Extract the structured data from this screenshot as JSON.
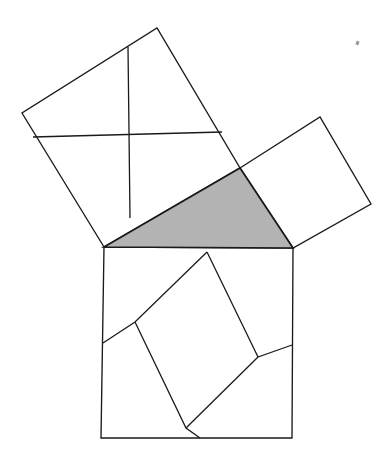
{
  "figure": {
    "background_color": "#ffffff",
    "line_color": "#1a1a1a",
    "shaded_fill_color": "#b3b3b3",
    "unshaded_fill_color": "#ffffff",
    "canvas": {
      "width": 391,
      "height": 468
    }
  },
  "shapes": {
    "triangle": {
      "name": "right-triangle",
      "fill": "#b3b3b3",
      "filled": true,
      "vertices": [
        [
          104,
          247
        ],
        [
          240,
          168
        ],
        [
          293,
          248
        ]
      ],
      "vertex_labels": [
        "left-vertex",
        "apex-vertex",
        "right-vertex"
      ]
    },
    "square_hypotenuse": {
      "name": "square-on-hypotenuse",
      "fill": "#ffffff",
      "filled": false,
      "position": "bottom",
      "vertices": [
        [
          104,
          247
        ],
        [
          293,
          248
        ],
        [
          292,
          438
        ],
        [
          101,
          438
        ]
      ]
    },
    "square_long_leg": {
      "name": "square-on-long-leg",
      "fill": "#ffffff",
      "filled": false,
      "position": "upper-left",
      "vertices": [
        [
          104,
          247
        ],
        [
          22,
          113
        ],
        [
          157,
          28
        ],
        [
          240,
          168
        ]
      ]
    },
    "square_short_leg": {
      "name": "square-on-short-leg",
      "fill": "#ffffff",
      "filled": false,
      "position": "upper-right",
      "vertices": [
        [
          240,
          168
        ],
        [
          320,
          117
        ],
        [
          371,
          204
        ],
        [
          293,
          248
        ]
      ]
    }
  },
  "dissection_lines": {
    "hypotenuse_square_cuts": [
      {
        "name": "cut-top-to-upper-left",
        "points": [
          [
            207,
            252
          ],
          [
            135,
            322
          ],
          [
            103,
            343
          ]
        ]
      },
      {
        "name": "cut-top-to-lower-right",
        "points": [
          [
            207,
            252
          ],
          [
            258,
            357
          ],
          [
            292,
            345
          ]
        ]
      },
      {
        "name": "cut-upper-left-to-bottom",
        "points": [
          [
            135,
            322
          ],
          [
            186,
            428
          ],
          [
            200,
            438
          ]
        ]
      },
      {
        "name": "cut-lower-right-to-bottom",
        "points": [
          [
            258,
            357
          ],
          [
            186,
            428
          ]
        ]
      }
    ],
    "long_leg_square_cuts": [
      {
        "name": "cut-vertical-midline",
        "points": [
          [
            128,
            47
          ],
          [
            130,
            218
          ]
        ]
      },
      {
        "name": "cut-horizontal-midline",
        "points": [
          [
            33,
            137
          ],
          [
            222,
            132
          ]
        ]
      }
    ],
    "short_leg_square_cuts": []
  },
  "artifacts": [
    {
      "name": "scan-speck",
      "x": 356,
      "y": 41,
      "width": 3,
      "height": 4
    }
  ]
}
